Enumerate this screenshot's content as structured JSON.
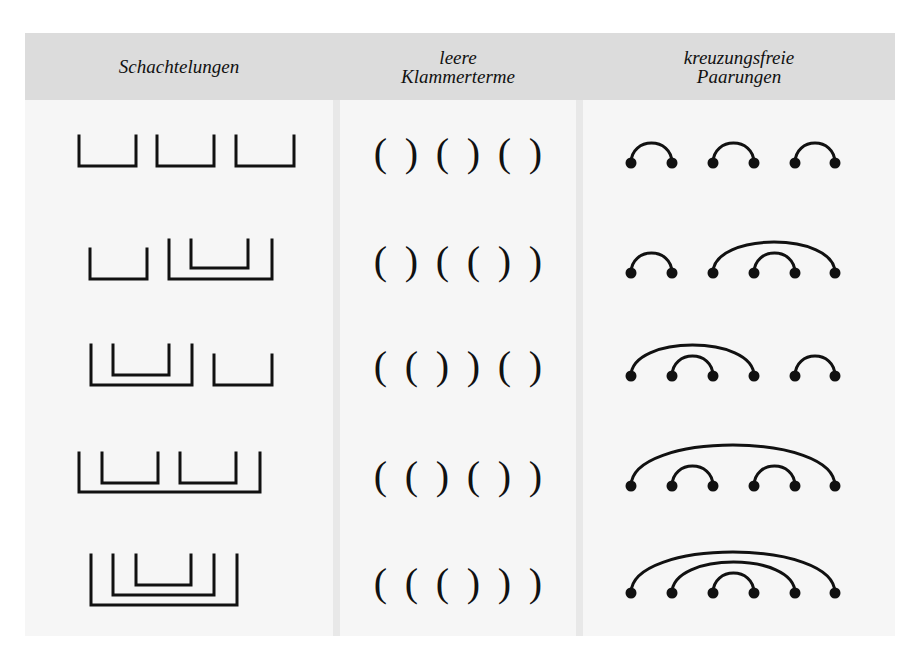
{
  "headers": {
    "col1": "Schachtelungen",
    "col2_line1": "leere",
    "col2_line2": "Klammerterme",
    "col3_line1": "kreuzungsfreie",
    "col3_line2": "Paarungen"
  },
  "rows": [
    {
      "index": 1,
      "parentheses": [
        "(",
        ")",
        "(",
        ")",
        "(",
        ")"
      ],
      "nesting": "[][][]",
      "pairings": [
        [
          1,
          2
        ],
        [
          3,
          4
        ],
        [
          5,
          6
        ]
      ]
    },
    {
      "index": 2,
      "parentheses": [
        "(",
        ")",
        "(",
        "(",
        ")",
        ")"
      ],
      "nesting": "[][[]]",
      "pairings": [
        [
          1,
          2
        ],
        [
          3,
          6
        ],
        [
          4,
          5
        ]
      ]
    },
    {
      "index": 3,
      "parentheses": [
        "(",
        "(",
        ")",
        ")",
        "(",
        ")"
      ],
      "nesting": "[[]][]",
      "pairings": [
        [
          1,
          4
        ],
        [
          2,
          3
        ],
        [
          5,
          6
        ]
      ]
    },
    {
      "index": 4,
      "parentheses": [
        "(",
        "(",
        ")",
        "(",
        ")",
        ")"
      ],
      "nesting": "[[][]]",
      "pairings": [
        [
          1,
          6
        ],
        [
          2,
          3
        ],
        [
          4,
          5
        ]
      ]
    },
    {
      "index": 5,
      "parentheses": [
        "(",
        "(",
        "(",
        ")",
        ")",
        ")"
      ],
      "nesting": "[[[]]]",
      "pairings": [
        [
          1,
          6
        ],
        [
          2,
          5
        ],
        [
          3,
          4
        ]
      ]
    }
  ],
  "colors": {
    "header_bg": "#dcdcdc",
    "body_bg": "#f6f6f6",
    "divider": "#e8e8e8",
    "ink": "#111111"
  }
}
